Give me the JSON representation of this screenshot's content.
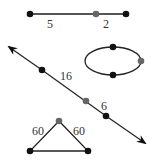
{
  "colors": {
    "line": "#333333",
    "dot_black": "#111111",
    "dot_gray": "#666666"
  },
  "figures": {
    "segment": {
      "labels": [
        "5",
        "2"
      ]
    },
    "line": {
      "labels": [
        "16",
        "6"
      ]
    },
    "ellipse": {
      "points": 3
    },
    "triangle": {
      "labels": [
        "60",
        "60"
      ]
    }
  }
}
